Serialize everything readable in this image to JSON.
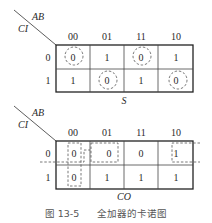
{
  "maps": [
    {
      "output_label": "S",
      "row_var": "CI",
      "col_var": "AB",
      "col_headers": [
        "00",
        "01",
        "11",
        "10"
      ],
      "row_headers": [
        "0",
        "1"
      ],
      "cells": [
        [
          "0",
          "1",
          "0",
          "1"
        ],
        [
          "1",
          "0",
          "1",
          "0"
        ]
      ],
      "groupings": "dashed circles around each 0 cell (no adjacent grouping)"
    },
    {
      "output_label": "CO",
      "row_var": "CI",
      "col_var": "AB",
      "col_headers": [
        "00",
        "01",
        "11",
        "10"
      ],
      "row_headers": [
        "0",
        "1"
      ],
      "cells": [
        [
          "0",
          "0",
          "0",
          "1"
        ],
        [
          "0",
          "1",
          "1",
          "1"
        ]
      ],
      "groupings": "dashed rectangles: column 00 vertical pair, row 0 cells 00-01 pair, row 0 wrap-around 10-00 pair"
    }
  ],
  "caption": {
    "figure_number": "图 13-5",
    "title": "全加器的卡诺图"
  }
}
